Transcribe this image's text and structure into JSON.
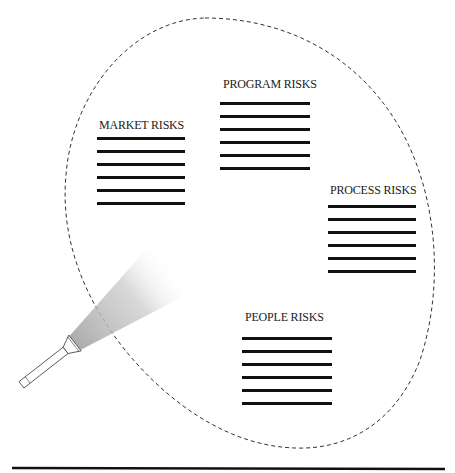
{
  "diagram": {
    "boundary": {
      "style": "dashed",
      "shape": "tilted-ellipse",
      "color": "#333333"
    },
    "groups": [
      {
        "id": "market",
        "label": "MARKET RISKS",
        "line_count": 6,
        "label_pos": [
          99,
          118
        ],
        "lines_x": 97,
        "lines_y": 138,
        "width": 88
      },
      {
        "id": "program",
        "label": "PROGRAM RISKS",
        "line_count": 6,
        "label_pos": [
          223,
          77
        ],
        "lines_x": 220,
        "lines_y": 102,
        "width": 90
      },
      {
        "id": "process",
        "label": "PROCESS RISKS",
        "line_count": 6,
        "label_pos": [
          330,
          183
        ],
        "lines_x": 328,
        "lines_y": 205,
        "width": 88
      },
      {
        "id": "people",
        "label": "PEOPLE RISKS",
        "line_count": 6,
        "label_pos": [
          245,
          310
        ],
        "lines_x": 242,
        "lines_y": 337,
        "width": 90
      }
    ],
    "flashlight": {
      "icon": "flashlight-icon",
      "beam_color": "#b8b8b8"
    },
    "baseline": {
      "color": "#111111"
    }
  }
}
